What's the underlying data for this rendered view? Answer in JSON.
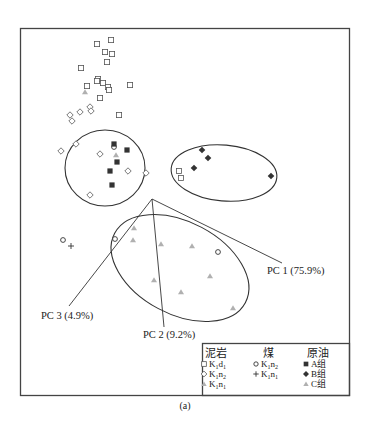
{
  "chart_data": {
    "type": "scatter",
    "title": "",
    "caption": "(a)",
    "xlabel": "",
    "ylabel": "",
    "grid": false,
    "legend_position": "bottom-right",
    "axes": [
      {
        "name": "PC 1 (75.9%)",
        "origin": [
          152,
          199
        ],
        "end": [
          282,
          263
        ],
        "label_pos": [
          267,
          274
        ]
      },
      {
        "name": "PC 2 (9.2%)",
        "origin": [
          152,
          199
        ],
        "end": [
          164,
          327
        ],
        "label_pos": [
          143,
          338
        ]
      },
      {
        "name": "PC 3 (4.9%)",
        "origin": [
          152,
          199
        ],
        "end": [
          69,
          306
        ],
        "label_pos": [
          41,
          319
        ]
      }
    ],
    "ellipses": [
      {
        "name": "A组 cluster",
        "cx": 105,
        "cy": 168,
        "rx": 40,
        "ry": 38,
        "rotate": 0
      },
      {
        "name": "B组 cluster",
        "cx": 224,
        "cy": 173,
        "rx": 53,
        "ry": 28,
        "rotate": 5
      },
      {
        "name": "C组 cluster",
        "cx": 180,
        "cy": 268,
        "rx": 74,
        "ry": 46,
        "rotate": 28
      }
    ],
    "series": [
      {
        "group": "泥岩",
        "name": "K1d1",
        "marker": "open-square",
        "points": [
          [
            97,
            44
          ],
          [
            111,
            40
          ],
          [
            105,
            52
          ],
          [
            112,
            54
          ],
          [
            107,
            62
          ],
          [
            81,
            68
          ],
          [
            98,
            79
          ],
          [
            97,
            81
          ],
          [
            103,
            83
          ],
          [
            108,
            87
          ],
          [
            109,
            90
          ],
          [
            87,
            86
          ],
          [
            130,
            85
          ],
          [
            100,
            98
          ],
          [
            119,
            115
          ],
          [
            179,
            171
          ],
          [
            181,
            178
          ]
        ]
      },
      {
        "group": "泥岩",
        "name": "K1n2",
        "marker": "open-diamond",
        "points": [
          [
            70,
            115
          ],
          [
            72,
            121
          ],
          [
            80,
            112
          ],
          [
            90,
            107
          ],
          [
            91,
            111
          ],
          [
            61,
            151
          ],
          [
            76,
            144
          ],
          [
            100,
            154
          ],
          [
            128,
            171
          ],
          [
            146,
            173
          ],
          [
            90,
            195
          ]
        ]
      },
      {
        "group": "泥岩",
        "name": "K1n1",
        "marker": "gray-triangle",
        "points": [
          [
            85,
            92
          ]
        ]
      },
      {
        "group": "煤",
        "name": "K1n2",
        "marker": "open-circle",
        "points": [
          [
            114,
            147
          ],
          [
            63,
            240
          ],
          [
            115,
            239
          ],
          [
            218,
            252
          ]
        ]
      },
      {
        "group": "煤",
        "name": "K1n1",
        "marker": "plus",
        "points": [
          [
            71,
            246
          ]
        ]
      },
      {
        "group": "原油",
        "name": "A组",
        "marker": "filled-square",
        "points": [
          [
            114,
            144
          ],
          [
            127,
            150
          ],
          [
            117,
            162
          ],
          [
            110,
            171
          ],
          [
            112,
            185
          ]
        ]
      },
      {
        "group": "原油",
        "name": "B组",
        "marker": "filled-diamond",
        "points": [
          [
            202,
            150
          ],
          [
            208,
            158
          ],
          [
            194,
            168
          ],
          [
            271,
            176
          ]
        ]
      },
      {
        "group": "原油",
        "name": "C组",
        "marker": "gray-triangle",
        "points": [
          [
            116,
            155
          ],
          [
            134,
            228
          ],
          [
            133,
            240
          ],
          [
            161,
            244
          ],
          [
            192,
            246
          ],
          [
            210,
            276
          ],
          [
            154,
            280
          ],
          [
            181,
            292
          ],
          [
            233,
            308
          ]
        ]
      }
    ]
  },
  "legend": {
    "columns": [
      {
        "header": "泥岩",
        "items": [
          {
            "marker": "open-square",
            "base": "K",
            "sub1": "1",
            "mid": "d",
            "sub2": "1"
          },
          {
            "marker": "open-diamond",
            "base": "K",
            "sub1": "1",
            "mid": "n",
            "sub2": "2"
          },
          {
            "marker": "gray-triangle",
            "base": "K",
            "sub1": "1",
            "mid": "n",
            "sub2": "1"
          }
        ]
      },
      {
        "header": "煤",
        "items": [
          {
            "marker": "open-circle",
            "base": "K",
            "sub1": "1",
            "mid": "n",
            "sub2": "2"
          },
          {
            "marker": "plus",
            "base": "K",
            "sub1": "1",
            "mid": "n",
            "sub2": "1"
          }
        ]
      },
      {
        "header": "原油",
        "items": [
          {
            "marker": "filled-square",
            "text": "A组"
          },
          {
            "marker": "filled-diamond",
            "text": "B组"
          },
          {
            "marker": "gray-triangle",
            "text": "C组"
          }
        ]
      }
    ]
  },
  "colors": {
    "line": "#333333",
    "triangle": "#b0b0b0",
    "filled": "#333333"
  }
}
